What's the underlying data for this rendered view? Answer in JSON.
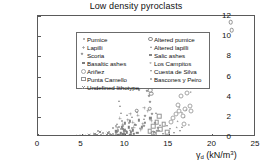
{
  "chart_data": {
    "type": "scatter",
    "title": "Low density pyroclasts",
    "xlabel": "γd (kN/m³)",
    "ylabel": "UCS (MPa)",
    "xlim": [
      0,
      25
    ],
    "ylim": [
      0,
      12
    ],
    "xticks": [
      0,
      5,
      10,
      15,
      20,
      25
    ],
    "yticks": [
      0,
      2,
      4,
      6,
      8,
      10,
      12
    ],
    "grid": false,
    "legend_position": "upper-left-inside",
    "legend_columns": 2,
    "series": [
      {
        "name": "Pumice",
        "marker": "m-dot",
        "points": [
          [
            8.9,
            0.35
          ],
          [
            9.2,
            0.55
          ],
          [
            9.0,
            0.2
          ],
          [
            9.5,
            0.75
          ],
          [
            8.6,
            0.3
          ],
          [
            9.8,
            1.05
          ],
          [
            10.1,
            0.6
          ],
          [
            9.3,
            0.95
          ],
          [
            10.4,
            1.35
          ],
          [
            9.9,
            0.45
          ],
          [
            8.3,
            0.25
          ],
          [
            10.8,
            0.85
          ],
          [
            9.6,
            1.55
          ],
          [
            11.2,
            1.15
          ],
          [
            10.0,
            0.3
          ]
        ]
      },
      {
        "name": "Lapilli",
        "marker": "m-plus",
        "points": [
          [
            9.1,
            0.9
          ],
          [
            9.7,
            1.25
          ],
          [
            10.3,
            1.7
          ],
          [
            10.9,
            1.45
          ],
          [
            11.5,
            2.15
          ],
          [
            12.0,
            1.3
          ],
          [
            11.0,
            0.95
          ],
          [
            12.6,
            2.55
          ],
          [
            10.6,
            2.3
          ],
          [
            9.4,
            1.85
          ],
          [
            13.0,
            1.6
          ],
          [
            12.2,
            2.9
          ],
          [
            11.8,
            0.7
          ]
        ]
      },
      {
        "name": "Scoria",
        "marker": "m-dia",
        "points": [
          [
            12.5,
            4.55
          ],
          [
            12.7,
            4.05
          ],
          [
            12.9,
            3.45
          ],
          [
            13.1,
            2.25
          ],
          [
            12.3,
            2.05
          ],
          [
            11.6,
            4.7
          ],
          [
            13.4,
            1.4
          ],
          [
            12.1,
            1.1
          ],
          [
            13.8,
            0.85
          ],
          [
            11.9,
            5.05
          ],
          [
            12.4,
            5.15
          ],
          [
            13.6,
            0.55
          ]
        ]
      },
      {
        "name": "Basaltic ashes",
        "marker": "m-sq",
        "points": [
          [
            9.2,
            0.15
          ],
          [
            9.5,
            0.35
          ],
          [
            9.8,
            0.25
          ],
          [
            10.2,
            0.45
          ],
          [
            10.6,
            0.2
          ],
          [
            9.0,
            0.55
          ],
          [
            11.0,
            0.3
          ],
          [
            8.8,
            0.1
          ],
          [
            10.9,
            0.65
          ],
          [
            11.4,
            0.4
          ],
          [
            9.7,
            0.8
          ],
          [
            10.4,
            0.95
          ]
        ]
      },
      {
        "name": "Ariñez",
        "marker": "m-ring",
        "points": [
          [
            15.8,
            2.3
          ],
          [
            16.2,
            2.55
          ],
          [
            16.6,
            2.1
          ],
          [
            16.0,
            3.15
          ],
          [
            16.9,
            2.75
          ],
          [
            15.5,
            1.85
          ],
          [
            17.1,
            4.35
          ],
          [
            16.4,
            4.1
          ],
          [
            17.4,
            3.05
          ],
          [
            15.2,
            1.45
          ],
          [
            16.8,
            1.25
          ],
          [
            17.6,
            2.6
          ]
        ]
      },
      {
        "name": "Punta Camello",
        "marker": "m-osq",
        "points": [
          [
            13.2,
            1.05
          ],
          [
            13.6,
            1.45
          ],
          [
            14.0,
            0.75
          ],
          [
            12.8,
            0.55
          ],
          [
            14.4,
            1.25
          ],
          [
            13.9,
            2.05
          ],
          [
            14.8,
            0.45
          ],
          [
            13.4,
            0.3
          ]
        ]
      },
      {
        "name": "Undefined lithotype",
        "marker": "m-x",
        "points": [
          [
            5.1,
            0.05
          ],
          [
            5.6,
            0.12
          ],
          [
            6.2,
            0.08
          ],
          [
            6.8,
            0.15
          ],
          [
            7.3,
            0.1
          ],
          [
            4.6,
            0.06
          ],
          [
            7.9,
            0.22
          ],
          [
            8.4,
            0.18
          ],
          [
            6.5,
            0.3
          ],
          [
            5.9,
            0.2
          ],
          [
            7.1,
            0.45
          ],
          [
            8.0,
            0.35
          ],
          [
            4.2,
            0.04
          ]
        ]
      },
      {
        "name": "Altered pumice",
        "marker": "m-odot",
        "points": [
          [
            22.1,
            11.4
          ],
          [
            22.2,
            10.6
          ],
          [
            16.1,
            6.15
          ],
          [
            12.9,
            4.65
          ],
          [
            13.0,
            4.3
          ],
          [
            12.8,
            2.8
          ],
          [
            11.3,
            2.6
          ],
          [
            13.2,
            0.4
          ]
        ]
      },
      {
        "name": "Altered lapilli",
        "marker": "m-tri",
        "points": [
          [
            9.3,
            3.55
          ],
          [
            9.4,
            3.05
          ],
          [
            9.5,
            2.35
          ],
          [
            10.2,
            2.2
          ],
          [
            10.8,
            1.95
          ],
          [
            11.4,
            2.45
          ],
          [
            12.2,
            1.75
          ],
          [
            9.1,
            1.3
          ],
          [
            14.0,
            1.15
          ],
          [
            16.5,
            0.95
          ],
          [
            11.7,
            0.85
          ],
          [
            10.5,
            0.65
          ],
          [
            13.5,
            2.35
          ],
          [
            15.0,
            0.5
          ]
        ]
      },
      {
        "name": "Salic ashes",
        "marker": "m-bar",
        "points": [
          [
            9.6,
            0.95
          ],
          [
            10.0,
            1.35
          ],
          [
            10.5,
            1.55
          ],
          [
            11.1,
            1.2
          ],
          [
            11.6,
            1.65
          ],
          [
            12.3,
            1.4
          ],
          [
            9.9,
            0.7
          ],
          [
            12.9,
            1.85
          ],
          [
            10.7,
            0.5
          ],
          [
            11.9,
            0.95
          ]
        ]
      },
      {
        "name": "Los Campitos",
        "marker": "m-star",
        "points": [
          [
            16.2,
            2.95
          ],
          [
            16.5,
            2.4
          ],
          [
            16.8,
            1.95
          ],
          [
            17.0,
            2.65
          ],
          [
            16.0,
            1.55
          ],
          [
            17.3,
            1.2
          ],
          [
            15.9,
            0.95
          ],
          [
            17.5,
            4.45
          ]
        ]
      },
      {
        "name": "Cuesta de Silva",
        "marker": "m-tdn",
        "points": [
          [
            14.8,
            1.05
          ],
          [
            15.1,
            0.75
          ],
          [
            13.9,
            0.55
          ],
          [
            15.6,
            0.35
          ],
          [
            14.3,
            0.25
          ],
          [
            16.3,
            0.6
          ],
          [
            13.3,
            0.45
          ]
        ]
      },
      {
        "name": "Bascones y Peiro",
        "marker": "m-dot",
        "points": [
          [
            6.9,
            0.6
          ],
          [
            7.5,
            0.35
          ],
          [
            8.1,
            0.5
          ],
          [
            8.6,
            0.85
          ],
          [
            7.2,
            0.18
          ],
          [
            8.9,
            1.1
          ],
          [
            6.4,
            0.25
          ],
          [
            9.2,
            0.7
          ]
        ]
      }
    ]
  },
  "legend": {
    "columns": [
      {
        "items": [
          {
            "label": "Pumice",
            "marker": "m-dot"
          },
          {
            "label": "Lapilli",
            "marker": "m-plus"
          },
          {
            "label": "Scoria",
            "marker": "m-dia"
          },
          {
            "label": "Basaltic ashes",
            "marker": "m-sq"
          },
          {
            "label": "Ariñez",
            "marker": "m-ring"
          },
          {
            "label": "Punta Camello",
            "marker": "m-osq"
          },
          {
            "label": "Undefined lithotype",
            "marker": "m-x"
          }
        ]
      },
      {
        "items": [
          {
            "label": "Altered pumice",
            "marker": "m-odot"
          },
          {
            "label": "Altered lapilli",
            "marker": "m-tri"
          },
          {
            "label": "Salic ashes",
            "marker": "m-bar"
          },
          {
            "label": "Los Campitos",
            "marker": "m-star"
          },
          {
            "label": "Cuesta de Silva",
            "marker": "m-tdn"
          },
          {
            "label": "Bascones y Peiro",
            "marker": "m-dot"
          }
        ]
      }
    ]
  },
  "axis_title_parts": {
    "gamma": "γ",
    "sub": "d",
    "unit_open": " (kN/m",
    "sup": "3",
    "unit_close": ")"
  }
}
